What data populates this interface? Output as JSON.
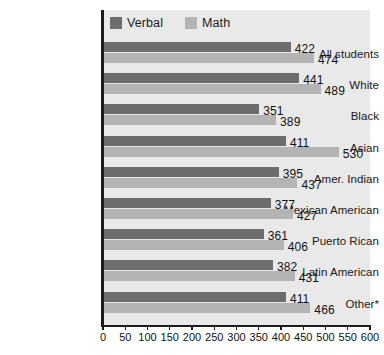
{
  "chart_data": {
    "type": "bar",
    "orientation": "horizontal",
    "title": "",
    "xlabel": "",
    "ylabel": "",
    "xlim": [
      0,
      600
    ],
    "xticks": [
      0,
      50,
      100,
      150,
      200,
      250,
      300,
      350,
      400,
      450,
      500,
      550,
      600
    ],
    "grid": false,
    "legend_position": "top-left",
    "categories": [
      "All students",
      "White",
      "Black",
      "Asian",
      "Amer. Indian",
      "Mexican American",
      "Puerto Rican",
      "Latin American",
      "Other*"
    ],
    "series": [
      {
        "name": "Verbal",
        "color": "#6d6d6d",
        "values": [
          422,
          441,
          351,
          411,
          395,
          377,
          361,
          382,
          411
        ]
      },
      {
        "name": "Math",
        "color": "#b4b4b4",
        "values": [
          474,
          489,
          389,
          530,
          437,
          427,
          406,
          431,
          466
        ]
      }
    ]
  },
  "legend": {
    "entries": [
      {
        "label": "Verbal",
        "color": "#6d6d6d"
      },
      {
        "label": "Math",
        "color": "#b4b4b4"
      }
    ]
  },
  "colors": {
    "verbal": "#6d6d6d",
    "math": "#b4b4b4",
    "panel": "#e9e9e9",
    "axis": "#1a1a1a",
    "page": "#ffffff"
  }
}
